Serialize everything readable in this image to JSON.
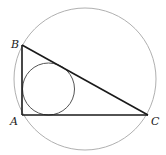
{
  "diagram": {
    "vertices": {
      "A": {
        "label": "A"
      },
      "B": {
        "label": "B"
      },
      "C": {
        "label": "C"
      }
    },
    "colors": {
      "triangle": "#1a1a1a",
      "incircle": "#555555",
      "circumcircle": "#b0b0b0",
      "labels": "#222222"
    }
  }
}
